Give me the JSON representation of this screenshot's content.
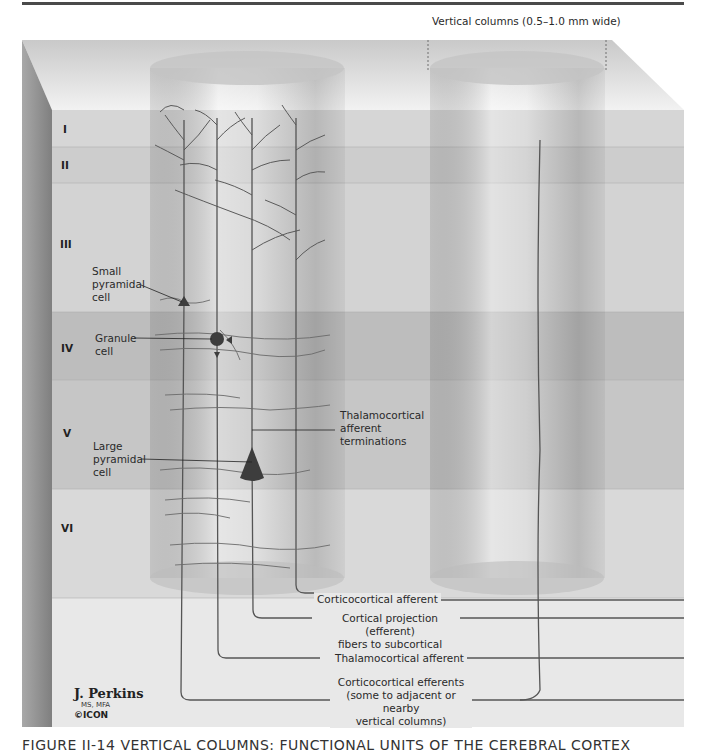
{
  "figure": {
    "header_annotation": "Vertical columns (0.5–1.0 mm wide)",
    "caption": "FIGURE II-14  VERTICAL COLUMNS: FUNCTIONAL UNITS OF THE CEREBRAL CORTEX",
    "colors": {
      "background": "#ffffff",
      "top_face": "#d9d9d9",
      "side_face": "#8c8c8c",
      "base_region": "#e6e6e6",
      "layer_light": "#d8d8d8",
      "layer_mid": "#cbcbcb",
      "layer_dark": "#b8b8b8",
      "fiber": "#555555",
      "neuron": "#3d3d3d"
    }
  },
  "layers": [
    {
      "label": "I",
      "y_top": 110,
      "y_bottom": 147
    },
    {
      "label": "II",
      "y_top": 147,
      "y_bottom": 183
    },
    {
      "label": "III",
      "y_top": 183,
      "y_bottom": 312
    },
    {
      "label": "IV",
      "y_top": 312,
      "y_bottom": 380
    },
    {
      "label": "V",
      "y_top": 380,
      "y_bottom": 489
    },
    {
      "label": "VI",
      "y_top": 489,
      "y_bottom": 598
    }
  ],
  "cell_labels": {
    "small_pyramidal": [
      "Small",
      "pyramidal",
      "cell"
    ],
    "granule": [
      "Granule",
      "cell"
    ],
    "large_pyramidal": [
      "Large",
      "pyramidal",
      "cell"
    ],
    "thalamocortical_terminations": [
      "Thalamocortical",
      "afferent",
      "terminations"
    ]
  },
  "fiber_labels": {
    "corticocortical_afferent": "Corticocortical afferent",
    "cortical_projection_1": "Cortical projection (efferent)",
    "cortical_projection_2": "fibers to subcortical structures",
    "thalamocortical_afferent": "Thalamocortical afferent",
    "corticocortical_efferents_1": "Corticocortical efferents",
    "corticocortical_efferents_2": "(some to adjacent or nearby",
    "corticocortical_efferents_3": "vertical columns)"
  },
  "credit": {
    "name": "J. Perkins",
    "degrees": "MS, MFA",
    "logo": "©ICON"
  }
}
